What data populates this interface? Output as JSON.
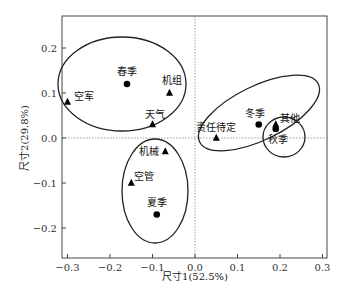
{
  "chart_data": {
    "type": "scatter",
    "title": "",
    "xlabel": "尺寸1(52.5%)",
    "ylabel": "尺寸2(29.8%)",
    "xlim": [
      -0.31,
      0.31
    ],
    "ylim": [
      -0.27,
      0.27
    ],
    "xticks": [
      -0.3,
      -0.2,
      -0.1,
      0.0,
      0.1,
      0.2,
      0.3
    ],
    "xtick_labels": [
      "−0.3",
      "−0.2",
      "−0.1",
      "0.0",
      "0.1",
      "0.2",
      "0.3"
    ],
    "yticks": [
      -0.2,
      -0.1,
      0.0,
      0.1,
      0.2
    ],
    "ytick_labels": [
      "−0.2",
      "−0.1",
      "0.0",
      "0.1",
      "0.2"
    ],
    "grid": false,
    "reference_lines": {
      "x": 0.0,
      "y": 0.0,
      "style": "dotted"
    },
    "series": [
      {
        "name": "季节",
        "marker": "circle",
        "points": [
          {
            "label": "春季",
            "x": -0.16,
            "y": 0.12
          },
          {
            "label": "夏季",
            "x": -0.09,
            "y": -0.17
          },
          {
            "label": "冬季",
            "x": 0.15,
            "y": 0.03
          },
          {
            "label": "秋季",
            "x": 0.19,
            "y": 0.02
          }
        ]
      },
      {
        "name": "原因",
        "marker": "triangle",
        "points": [
          {
            "label": "空军",
            "x": -0.3,
            "y": 0.08
          },
          {
            "label": "机组",
            "x": -0.06,
            "y": 0.1
          },
          {
            "label": "天气",
            "x": -0.1,
            "y": 0.03
          },
          {
            "label": "机械",
            "x": -0.07,
            "y": -0.03
          },
          {
            "label": "空管",
            "x": -0.15,
            "y": -0.1
          },
          {
            "label": "责任待定",
            "x": 0.05,
            "y": 0.0
          },
          {
            "label": "其他",
            "x": 0.19,
            "y": 0.03
          }
        ]
      }
    ],
    "clusters": [
      {
        "members": [
          "空军",
          "春季",
          "机组",
          "天气"
        ],
        "shape": "ellipse"
      },
      {
        "members": [
          "机械",
          "空管",
          "夏季"
        ],
        "shape": "ellipse"
      },
      {
        "members": [
          "责任待定",
          "冬季",
          "其他"
        ],
        "shape": "ellipse"
      },
      {
        "members": [
          "秋季",
          "其他"
        ],
        "shape": "circle"
      }
    ]
  }
}
